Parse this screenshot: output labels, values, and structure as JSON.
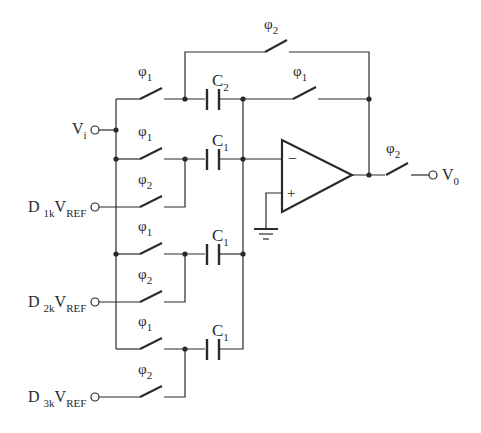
{
  "diagram": {
    "type": "switched-capacitor circuit schematic",
    "terminals": {
      "vi": {
        "main": "V",
        "sub": "i"
      },
      "v0": {
        "main": "V",
        "sub": "0"
      },
      "d1": {
        "main": "D",
        "sub": "1k",
        "main2": "V",
        "sub2": "REF"
      },
      "d2": {
        "main": "D",
        "sub": "2k",
        "main2": "V",
        "sub2": "REF"
      },
      "d3": {
        "main": "D",
        "sub": "3k",
        "main2": "V",
        "sub2": "REF"
      }
    },
    "switches": {
      "top_bypass": {
        "phase": "φ",
        "sub": "2"
      },
      "feedback": {
        "phase": "φ",
        "sub": "1"
      },
      "c2_input": {
        "phase": "φ",
        "sub": "1"
      },
      "row1_phi1": {
        "phase": "φ",
        "sub": "1"
      },
      "row1_phi2": {
        "phase": "φ",
        "sub": "2"
      },
      "row2_phi1": {
        "phase": "φ",
        "sub": "1"
      },
      "row2_phi2": {
        "phase": "φ",
        "sub": "2"
      },
      "row3_phi1": {
        "phase": "φ",
        "sub": "1"
      },
      "row3_phi2": {
        "phase": "φ",
        "sub": "2"
      },
      "output": {
        "phase": "φ",
        "sub": "2"
      }
    },
    "capacitors": {
      "c2": {
        "main": "C",
        "sub": "2"
      },
      "c1a": {
        "main": "C",
        "sub": "1"
      },
      "c1b": {
        "main": "C",
        "sub": "1"
      },
      "c1c": {
        "main": "C",
        "sub": "1"
      }
    },
    "opamp": {
      "inverting": "−",
      "noninverting": "+"
    }
  }
}
